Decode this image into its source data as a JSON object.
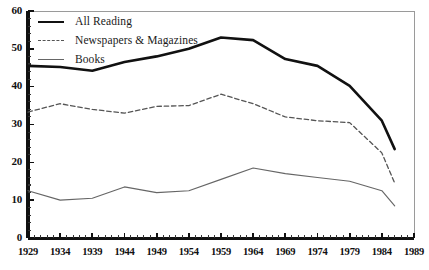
{
  "chart_data": {
    "type": "line",
    "title": "",
    "xlabel": "",
    "ylabel": "",
    "xlim": [
      1929,
      1989
    ],
    "ylim": [
      0,
      60
    ],
    "grid": false,
    "legend_position": "top-left",
    "ytick_labels": [
      "60",
      "50",
      "40",
      "30",
      "20",
      "10",
      "0"
    ],
    "yticks": [
      60,
      50,
      40,
      30,
      20,
      10,
      0
    ],
    "xtick_labels": [
      "1929",
      "1934",
      "1939",
      "1944",
      "1949",
      "1954",
      "1959",
      "1964",
      "1969",
      "1974",
      "1979",
      "1984",
      "1989"
    ],
    "xticks": [
      1929,
      1934,
      1939,
      1944,
      1949,
      1954,
      1959,
      1964,
      1969,
      1974,
      1979,
      1984,
      1989
    ],
    "minor_tick_interval": 1,
    "x": [
      1929,
      1934,
      1939,
      1944,
      1949,
      1954,
      1959,
      1964,
      1969,
      1974,
      1979,
      1984,
      1986
    ],
    "series": [
      {
        "name": "All Reading",
        "style": "solid-thick",
        "color": "#111111",
        "values": [
          45.5,
          45.2,
          44.2,
          46.5,
          48.0,
          50.0,
          53.0,
          52.3,
          47.3,
          45.5,
          40.2,
          31.0,
          23.5
        ]
      },
      {
        "name": "Newspapers & Magazines",
        "style": "dashed",
        "color": "#555555",
        "values": [
          33.3,
          35.5,
          34.0,
          33.0,
          34.8,
          35.0,
          38.0,
          35.5,
          32.0,
          31.0,
          30.5,
          22.5,
          14.5
        ]
      },
      {
        "name": "Books",
        "style": "solid-thin",
        "color": "#666666",
        "values": [
          12.5,
          10.0,
          10.5,
          13.5,
          12.0,
          12.5,
          15.5,
          18.5,
          17.0,
          16.0,
          15.0,
          12.5,
          8.5
        ]
      }
    ]
  },
  "legend": {
    "items": [
      {
        "label": "All Reading",
        "swatch": "legend-line-all-reading"
      },
      {
        "label": "Newspapers & Magazines",
        "swatch": "legend-line-newspapers"
      },
      {
        "label": "Books",
        "swatch": "legend-line-books"
      }
    ]
  }
}
